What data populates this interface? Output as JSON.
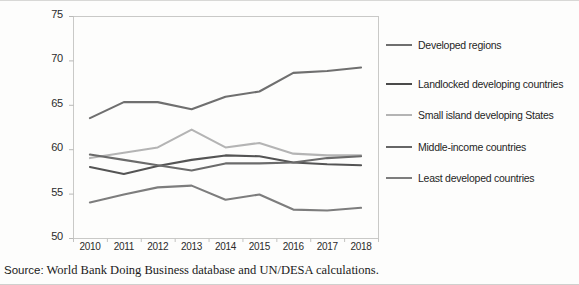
{
  "source_note": {
    "label": "Source:",
    "text": "World Bank Doing Business database and UN/DESA calculations."
  },
  "chart_data": {
    "type": "line",
    "title": "",
    "subtitle": "",
    "xlabel": "",
    "ylabel": "",
    "categories": [
      "2010",
      "2011",
      "2012",
      "2013",
      "2014",
      "2015",
      "2016",
      "2017",
      "2018"
    ],
    "x": [
      2010,
      2011,
      2012,
      2013,
      2014,
      2015,
      2016,
      2017,
      2018
    ],
    "ylim": [
      50,
      75
    ],
    "yticks": [
      50,
      55,
      60,
      65,
      70,
      75
    ],
    "ytick_labels": [
      "50",
      "55",
      "60",
      "65",
      "70",
      "75"
    ],
    "grid": false,
    "legend_position": "right",
    "series": [
      {
        "name": "Developed regions",
        "color": "#6f6f6f",
        "values": [
          63.5,
          65.3,
          65.3,
          64.5,
          65.9,
          66.5,
          68.6,
          68.8,
          69.2
        ]
      },
      {
        "name": "Landlocked developing countries",
        "color": "#545454",
        "values": [
          58.0,
          57.2,
          58.1,
          58.8,
          59.3,
          59.2,
          58.5,
          58.3,
          58.2
        ]
      },
      {
        "name": "Small island developing States",
        "color": "#b4b4b4",
        "values": [
          59.0,
          59.6,
          60.2,
          62.2,
          60.2,
          60.7,
          59.5,
          59.3,
          59.3
        ]
      },
      {
        "name": "Middle-income countries",
        "color": "#6b6b6b",
        "values": [
          59.4,
          58.8,
          58.2,
          57.6,
          58.4,
          58.4,
          58.5,
          59.0,
          59.2
        ]
      },
      {
        "name": "Least developed countries",
        "color": "#7d7d7d",
        "values": [
          54.0,
          54.9,
          55.7,
          55.9,
          54.3,
          54.9,
          53.2,
          53.1,
          53.4
        ]
      }
    ]
  },
  "legend": {
    "items": [
      {
        "label": "Developed regions",
        "color": "#6f6f6f"
      },
      {
        "label": "Landlocked developing countries",
        "color": "#4a4a4a"
      },
      {
        "label": "Small island developing States",
        "color": "#b4b4b4"
      },
      {
        "label": "Middle-income countries",
        "color": "#666666"
      },
      {
        "label": "Least developed countries",
        "color": "#7d7d7d"
      }
    ]
  }
}
